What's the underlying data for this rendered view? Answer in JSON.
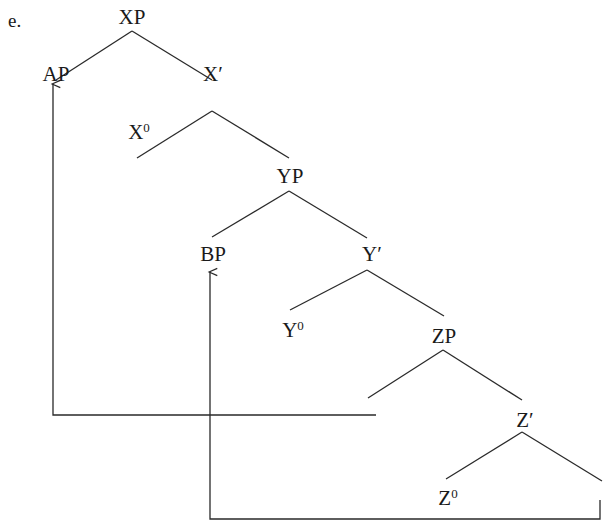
{
  "example_label": "e.",
  "nodes": [
    {
      "id": "XP",
      "base": "XP",
      "sup": "",
      "x": 132,
      "y": 17
    },
    {
      "id": "AP",
      "base": "AP",
      "sup": "",
      "x": 56,
      "y": 74
    },
    {
      "id": "X-bar",
      "base": "X′",
      "sup": "",
      "x": 213,
      "y": 74
    },
    {
      "id": "X0",
      "base": "X",
      "sup": "0",
      "x": 139,
      "y": 132
    },
    {
      "id": "YP",
      "base": "YP",
      "sup": "",
      "x": 290,
      "y": 176
    },
    {
      "id": "BP",
      "base": "BP",
      "sup": "",
      "x": 213,
      "y": 254
    },
    {
      "id": "Y-bar",
      "base": "Y′",
      "sup": "",
      "x": 372,
      "y": 254
    },
    {
      "id": "Y0",
      "base": "Y",
      "sup": "0",
      "x": 293,
      "y": 330
    },
    {
      "id": "ZP",
      "base": "ZP",
      "sup": "",
      "x": 444,
      "y": 336
    },
    {
      "id": "Z-bar",
      "base": "Z′",
      "sup": "",
      "x": 525,
      "y": 420
    },
    {
      "id": "Z0",
      "base": "Z",
      "sup": "0",
      "x": 448,
      "y": 498
    }
  ],
  "edges": [
    [
      132,
      31,
      56,
      80
    ],
    [
      132,
      31,
      212,
      80
    ],
    [
      212,
      111,
      137,
      158
    ],
    [
      212,
      111,
      289,
      158
    ],
    [
      289,
      191,
      212,
      237
    ],
    [
      289,
      191,
      367,
      238
    ],
    [
      367,
      270,
      290,
      310
    ],
    [
      367,
      270,
      444,
      316
    ],
    [
      443,
      350,
      368,
      398
    ],
    [
      443,
      350,
      522,
      400
    ],
    [
      522,
      432,
      446,
      479
    ],
    [
      522,
      432,
      602,
      481
    ]
  ],
  "movement_arrows": [
    {
      "from": "trace-spec-ZP",
      "to": "AP",
      "points": [
        [
          376,
          415
        ],
        [
          53,
          415
        ],
        [
          53,
          84
        ]
      ]
    },
    {
      "from": "trace-compl-Z",
      "to": "BP",
      "points": [
        [
          600,
          500
        ],
        [
          600,
          519
        ],
        [
          210,
          519
        ],
        [
          210,
          272
        ]
      ]
    }
  ],
  "colors": {
    "line": "#2a2a2a",
    "text": "#1a1a1a",
    "background": "#ffffff"
  }
}
